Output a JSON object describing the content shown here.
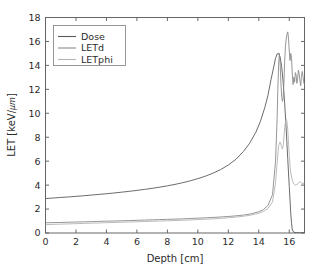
{
  "chart_data": {
    "type": "line",
    "title": "",
    "xlabel": "Depth [cm]",
    "ylabel": "LET [keV/μm]",
    "ylabel_main": "LET [keV/",
    "ylabel_unit": "μm",
    "ylabel_close": "]",
    "xlim": [
      0,
      17
    ],
    "ylim": [
      0,
      18
    ],
    "xticks": [
      0,
      2,
      4,
      6,
      8,
      10,
      12,
      14,
      16
    ],
    "yticks": [
      0,
      2,
      4,
      6,
      8,
      10,
      12,
      14,
      16,
      18
    ],
    "xtick_labels": [
      "0",
      "2",
      "4",
      "6",
      "8",
      "10",
      "12",
      "14",
      "16"
    ],
    "ytick_labels": [
      "0",
      "2",
      "4",
      "6",
      "8",
      "10",
      "12",
      "14",
      "16",
      "18"
    ],
    "grid": false,
    "legend_position": "upper left",
    "legend_entries": [
      "Dose",
      "LETd",
      "LETphi"
    ],
    "series": [
      {
        "name": "Dose",
        "color": "#5a5a5a",
        "x": [
          0.0,
          0.5,
          1.0,
          1.5,
          2.0,
          2.5,
          3.0,
          3.5,
          4.0,
          4.5,
          5.0,
          5.5,
          6.0,
          6.5,
          7.0,
          7.5,
          8.0,
          8.5,
          9.0,
          9.5,
          10.0,
          10.5,
          11.0,
          11.5,
          12.0,
          12.5,
          13.0,
          13.4,
          13.8,
          14.1,
          14.4,
          14.6,
          14.8,
          14.95,
          15.1,
          15.2,
          15.3,
          15.4,
          15.5,
          15.6,
          15.7,
          15.8,
          15.9,
          16.0,
          16.1,
          16.15,
          16.2,
          16.3,
          16.5,
          17.0
        ],
        "y": [
          2.88,
          2.92,
          2.97,
          3.01,
          3.06,
          3.11,
          3.17,
          3.22,
          3.28,
          3.34,
          3.41,
          3.48,
          3.56,
          3.64,
          3.73,
          3.83,
          3.94,
          4.06,
          4.2,
          4.36,
          4.54,
          4.75,
          5.0,
          5.3,
          5.68,
          6.16,
          6.82,
          7.5,
          8.4,
          9.3,
          10.5,
          11.5,
          12.8,
          13.7,
          14.6,
          14.95,
          15.0,
          14.7,
          13.9,
          12.6,
          10.8,
          8.6,
          6.2,
          3.9,
          1.6,
          0.8,
          0.25,
          0.06,
          0.02,
          0.01
        ]
      },
      {
        "name": "LETd",
        "color": "#8a8a8a",
        "x": [
          0.0,
          0.5,
          1.0,
          1.5,
          2.0,
          2.5,
          3.0,
          3.5,
          4.0,
          4.5,
          5.0,
          5.5,
          6.0,
          6.5,
          7.0,
          7.5,
          8.0,
          8.5,
          9.0,
          9.5,
          10.0,
          10.5,
          11.0,
          11.5,
          12.0,
          12.5,
          13.0,
          13.5,
          14.0,
          14.3,
          14.6,
          14.9,
          15.1,
          15.2,
          15.25,
          15.3,
          15.35,
          15.4,
          15.45,
          15.5,
          15.55,
          15.6,
          15.65,
          15.7,
          15.75,
          15.8,
          15.85,
          15.9,
          15.95,
          16.0,
          16.05,
          16.1,
          16.15,
          16.2,
          16.25,
          16.3,
          16.35,
          16.4,
          16.45,
          16.5,
          16.55,
          16.6,
          16.65,
          16.7,
          16.75,
          16.8,
          16.85,
          16.9,
          16.95,
          17.0
        ],
        "y": [
          0.85,
          0.87,
          0.88,
          0.9,
          0.92,
          0.93,
          0.95,
          0.97,
          0.99,
          1.0,
          1.02,
          1.04,
          1.06,
          1.08,
          1.1,
          1.12,
          1.14,
          1.16,
          1.18,
          1.21,
          1.24,
          1.27,
          1.3,
          1.34,
          1.38,
          1.43,
          1.5,
          1.6,
          1.78,
          1.95,
          2.3,
          3.2,
          6.0,
          9.5,
          12.0,
          14.0,
          15.0,
          14.2,
          12.6,
          11.4,
          11.0,
          11.3,
          12.6,
          14.4,
          15.6,
          16.2,
          16.6,
          16.8,
          16.3,
          15.2,
          14.4,
          15.0,
          14.6,
          13.3,
          12.4,
          13.0,
          12.6,
          13.4,
          13.2,
          12.5,
          12.9,
          13.6,
          13.3,
          12.7,
          12.3,
          13.0,
          13.5,
          13.1,
          12.6,
          12.4
        ]
      },
      {
        "name": "LETphi",
        "color": "#b4b4b4",
        "x": [
          0.0,
          0.5,
          1.0,
          1.5,
          2.0,
          2.5,
          3.0,
          3.5,
          4.0,
          4.5,
          5.0,
          5.5,
          6.0,
          6.5,
          7.0,
          7.5,
          8.0,
          8.5,
          9.0,
          9.5,
          10.0,
          10.5,
          11.0,
          11.5,
          12.0,
          12.5,
          13.0,
          13.5,
          14.0,
          14.3,
          14.6,
          14.9,
          15.1,
          15.2,
          15.3,
          15.4,
          15.5,
          15.55,
          15.6,
          15.65,
          15.7,
          15.75,
          15.8,
          15.85,
          15.9,
          15.95,
          16.0,
          16.05,
          16.1,
          16.2,
          16.3,
          16.4,
          16.5,
          16.6,
          16.7,
          16.8,
          16.9,
          17.0
        ],
        "y": [
          0.7,
          0.72,
          0.74,
          0.76,
          0.78,
          0.8,
          0.82,
          0.84,
          0.86,
          0.88,
          0.9,
          0.92,
          0.94,
          0.96,
          0.98,
          1.0,
          1.02,
          1.04,
          1.06,
          1.09,
          1.12,
          1.15,
          1.18,
          1.22,
          1.27,
          1.33,
          1.4,
          1.5,
          1.65,
          1.8,
          2.05,
          2.6,
          4.2,
          5.8,
          7.3,
          7.6,
          7.2,
          7.0,
          7.3,
          8.0,
          8.8,
          9.3,
          9.5,
          9.3,
          8.6,
          7.6,
          6.5,
          5.6,
          5.0,
          4.4,
          4.1,
          4.0,
          4.05,
          4.15,
          4.3,
          4.2,
          4.1,
          4.25
        ]
      }
    ]
  },
  "figure": {
    "background": "#ffffff",
    "axes_color": "#555555",
    "text_color": "#2b2b2b"
  }
}
